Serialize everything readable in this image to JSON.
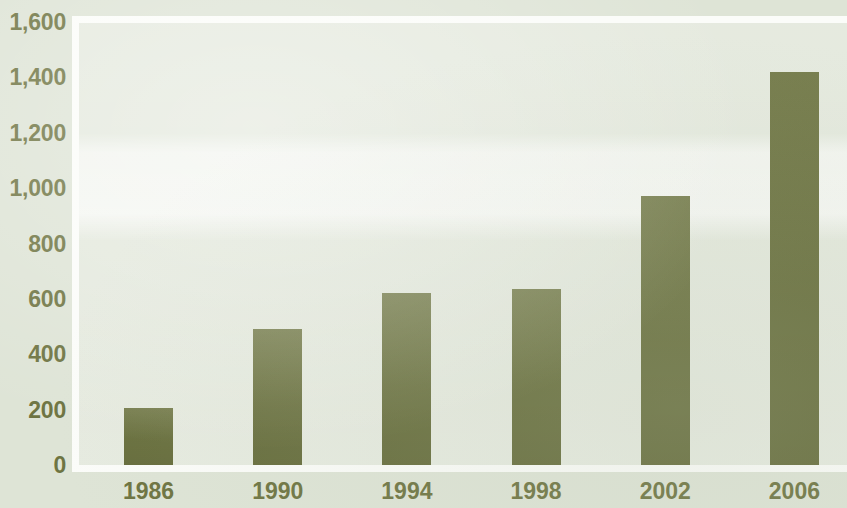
{
  "chart_data": {
    "type": "bar",
    "title": "",
    "subtitle": "",
    "xlabel": "",
    "ylabel": "",
    "categories": [
      "1986",
      "1990",
      "1994",
      "1998",
      "2002",
      "2006"
    ],
    "values": [
      205,
      490,
      620,
      635,
      970,
      1420
    ],
    "series": [
      {
        "name": "",
        "values": [
          205,
          490,
          620,
          635,
          970,
          1420
        ]
      }
    ],
    "ylim": [
      0,
      1600
    ],
    "yticks": [
      0,
      200,
      400,
      600,
      800,
      1000,
      1200,
      1400,
      1600
    ],
    "ytick_labels": [
      "0",
      "200",
      "400",
      "600",
      "800",
      "1,000",
      "1,200",
      "1,400",
      "1,600"
    ],
    "xtick_labels": [
      "1986",
      "1990",
      "1994",
      "1998",
      "2002",
      "2006"
    ],
    "grid": false,
    "legend": null,
    "legend_position": "none",
    "annotations": [],
    "colors": {
      "bar": "#6d7441",
      "text": "#6e7442",
      "page_background": "#dee4d6",
      "plot_background": "#e3e8dc",
      "frame_line": "#fbfcf9"
    }
  }
}
